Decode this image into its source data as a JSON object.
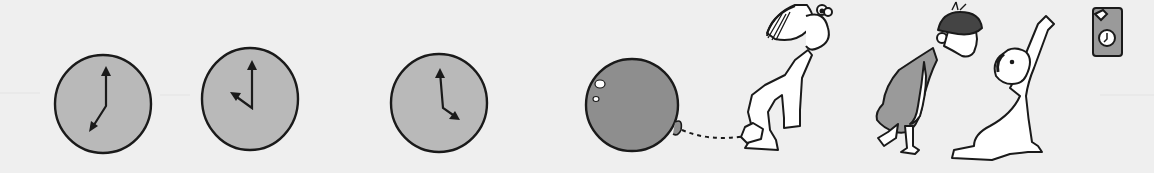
{
  "scene": {
    "description": "Illustration: three clocks, a ball tied to a child, a child in a dress, and a child reaching for a wall clock",
    "colors": {
      "background": "#efefef",
      "clock_face": "#b9b9b9",
      "ball": "#8e8e8e",
      "dress": "#9a9a9a",
      "ink": "#1a1a1a",
      "skin": "#ffffff"
    }
  },
  "clocks": [
    {
      "label": "clock-1",
      "time": "7:00",
      "cx": 103,
      "cy": 103,
      "r": 47,
      "hour_deg": 210,
      "minute_deg": 5
    },
    {
      "label": "clock-2",
      "time": "10:00",
      "cx": 250,
      "cy": 98,
      "r": 48,
      "hour_deg": 300,
      "minute_deg": 0
    },
    {
      "label": "clock-3",
      "time": "4:00",
      "cx": 439,
      "cy": 103,
      "r": 48,
      "hour_deg": 130,
      "minute_deg": 355
    }
  ],
  "ball": {
    "cx": 632,
    "cy": 103,
    "r": 46
  },
  "wall_clock": {
    "time": "7:00"
  }
}
